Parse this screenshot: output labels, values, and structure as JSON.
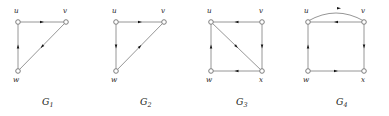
{
  "figure": {
    "background_color": "#ffffff",
    "edge_color": "#8a8a8a",
    "arrow_color": "#151515",
    "node_stroke_color": "#6f6f6f",
    "node_fill_color": "#ffffff",
    "text_color": "#1a1a1a"
  },
  "graphs": [
    {
      "id": "G1",
      "caption_base": "G",
      "caption_sub": "1",
      "vertices": [
        {
          "name": "u",
          "label": "u",
          "x": 18,
          "y": 22,
          "label_x": 14,
          "label_y": 13
        },
        {
          "name": "v",
          "label": "v",
          "x": 66,
          "y": 22,
          "label_x": 63,
          "label_y": 13
        },
        {
          "name": "w",
          "label": "w",
          "x": 18,
          "y": 71,
          "label_x": 13,
          "label_y": 82
        }
      ],
      "edges": [
        {
          "from": "u",
          "to": "v",
          "type": "straight",
          "direction": "right"
        },
        {
          "from": "v",
          "to": "w",
          "type": "straight",
          "direction": "down-left"
        },
        {
          "from": "w",
          "to": "u",
          "type": "straight",
          "direction": "up"
        }
      ]
    },
    {
      "id": "G2",
      "caption_base": "G",
      "caption_sub": "2",
      "vertices": [
        {
          "name": "u",
          "label": "u",
          "x": 116,
          "y": 22,
          "label_x": 112,
          "label_y": 13
        },
        {
          "name": "v",
          "label": "v",
          "x": 164,
          "y": 22,
          "label_x": 161,
          "label_y": 13
        },
        {
          "name": "w",
          "label": "w",
          "x": 116,
          "y": 71,
          "label_x": 111,
          "label_y": 82
        }
      ],
      "edges": [
        {
          "from": "u",
          "to": "v",
          "type": "straight",
          "direction": "right"
        },
        {
          "from": "u",
          "to": "w",
          "type": "straight",
          "direction": "down"
        },
        {
          "from": "w",
          "to": "v",
          "type": "straight",
          "direction": "up-right"
        }
      ]
    },
    {
      "id": "G3",
      "caption_base": "G",
      "caption_sub": "3",
      "vertices": [
        {
          "name": "u",
          "label": "u",
          "x": 211,
          "y": 22,
          "label_x": 207,
          "label_y": 13
        },
        {
          "name": "v",
          "label": "v",
          "x": 262,
          "y": 22,
          "label_x": 259,
          "label_y": 13
        },
        {
          "name": "w",
          "label": "w",
          "x": 211,
          "y": 71,
          "label_x": 206,
          "label_y": 82
        },
        {
          "name": "x",
          "label": "x",
          "x": 262,
          "y": 71,
          "label_x": 259,
          "label_y": 82
        }
      ],
      "edges": [
        {
          "from": "v",
          "to": "u",
          "type": "straight",
          "direction": "left"
        },
        {
          "from": "v",
          "to": "x",
          "type": "straight",
          "direction": "down"
        },
        {
          "from": "x",
          "to": "w",
          "type": "straight",
          "direction": "left"
        },
        {
          "from": "w",
          "to": "u",
          "type": "straight",
          "direction": "up"
        },
        {
          "from": "u",
          "to": "x",
          "type": "straight",
          "direction": "down-right"
        }
      ]
    },
    {
      "id": "G4",
      "caption_base": "G",
      "caption_sub": "4",
      "vertices": [
        {
          "name": "u",
          "label": "u",
          "x": 308,
          "y": 22,
          "label_x": 304,
          "label_y": 13
        },
        {
          "name": "v",
          "label": "v",
          "x": 364,
          "y": 22,
          "label_x": 361,
          "label_y": 13
        },
        {
          "name": "w",
          "label": "w",
          "x": 308,
          "y": 71,
          "label_x": 303,
          "label_y": 82
        },
        {
          "name": "x",
          "label": "x",
          "x": 364,
          "y": 71,
          "label_x": 361,
          "label_y": 82
        }
      ],
      "edges": [
        {
          "from": "u",
          "to": "v",
          "type": "curved",
          "direction": "right"
        },
        {
          "from": "v",
          "to": "u",
          "type": "straight",
          "direction": "left"
        },
        {
          "from": "v",
          "to": "x",
          "type": "straight",
          "direction": "down"
        },
        {
          "from": "w",
          "to": "x",
          "type": "straight",
          "direction": "right"
        },
        {
          "from": "w",
          "to": "u",
          "type": "straight",
          "direction": "up"
        }
      ]
    }
  ],
  "captions": [
    {
      "base": "G",
      "sub": "1",
      "x": 42,
      "y": 105
    },
    {
      "base": "G",
      "sub": "2",
      "x": 140,
      "y": 105
    },
    {
      "base": "G",
      "sub": "3",
      "x": 236,
      "y": 105
    },
    {
      "base": "G",
      "sub": "4",
      "x": 336,
      "y": 105
    }
  ]
}
